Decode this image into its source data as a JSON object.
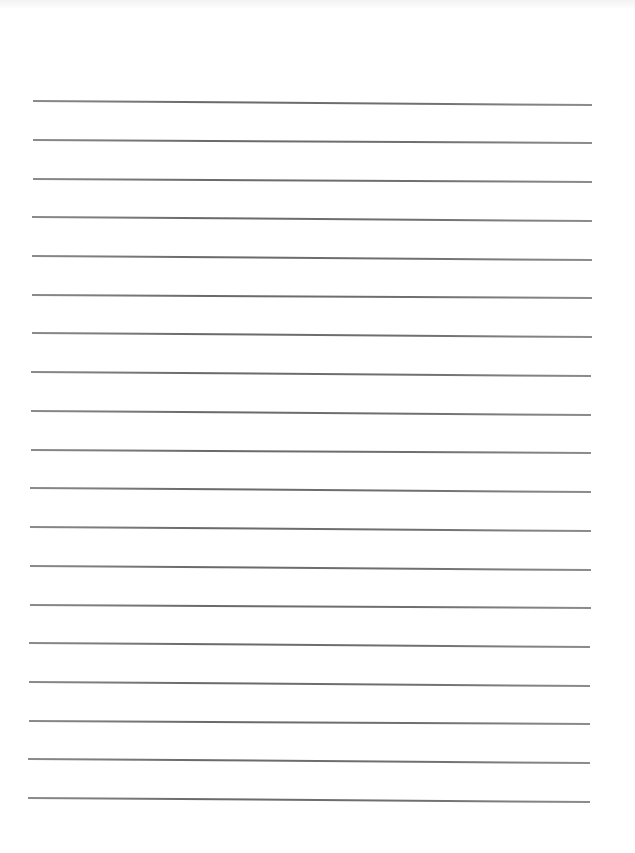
{
  "page": {
    "type": "blank lined paper",
    "background_color": "#ffffff",
    "line_color": "#6e6e6e"
  },
  "lines": [
    {
      "x1": 33,
      "y1": 100,
      "x2": 592,
      "y2": 104
    },
    {
      "x1": 33,
      "y1": 139,
      "x2": 592,
      "y2": 142
    },
    {
      "x1": 33,
      "y1": 178,
      "x2": 592,
      "y2": 181
    },
    {
      "x1": 32,
      "y1": 216,
      "x2": 592,
      "y2": 220
    },
    {
      "x1": 32,
      "y1": 255,
      "x2": 592,
      "y2": 259
    },
    {
      "x1": 32,
      "y1": 294,
      "x2": 592,
      "y2": 297
    },
    {
      "x1": 32,
      "y1": 332,
      "x2": 592,
      "y2": 336
    },
    {
      "x1": 31,
      "y1": 371,
      "x2": 591,
      "y2": 375
    },
    {
      "x1": 31,
      "y1": 410,
      "x2": 591,
      "y2": 414
    },
    {
      "x1": 31,
      "y1": 449,
      "x2": 591,
      "y2": 452
    },
    {
      "x1": 30,
      "y1": 487,
      "x2": 591,
      "y2": 491
    },
    {
      "x1": 30,
      "y1": 526,
      "x2": 591,
      "y2": 530
    },
    {
      "x1": 30,
      "y1": 565,
      "x2": 591,
      "y2": 569
    },
    {
      "x1": 30,
      "y1": 604,
      "x2": 591,
      "y2": 607
    },
    {
      "x1": 29,
      "y1": 642,
      "x2": 590,
      "y2": 646
    },
    {
      "x1": 29,
      "y1": 681,
      "x2": 590,
      "y2": 685
    },
    {
      "x1": 29,
      "y1": 720,
      "x2": 590,
      "y2": 723
    },
    {
      "x1": 28,
      "y1": 758,
      "x2": 590,
      "y2": 762
    },
    {
      "x1": 28,
      "y1": 797,
      "x2": 590,
      "y2": 801
    }
  ]
}
